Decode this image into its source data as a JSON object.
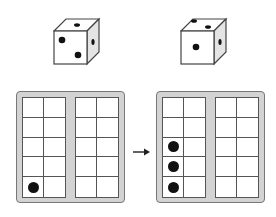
{
  "dice": [
    {
      "id": "die-left",
      "front_face_pips": 2,
      "top_face_pips": 1,
      "side_face_pips": 1
    },
    {
      "id": "die-right",
      "front_face_pips": 1,
      "top_face_pips": 2,
      "side_face_pips": 1
    }
  ],
  "ten_frames": [
    {
      "id": "frame-before",
      "filled_cells": [
        [
          4,
          0
        ]
      ]
    },
    {
      "id": "frame-after",
      "filled_cells": [
        [
          2,
          0
        ],
        [
          3,
          0
        ],
        [
          4,
          0
        ]
      ]
    }
  ],
  "arrow": {
    "direction": "right"
  },
  "colors": {
    "frame_bg": "#d3d3d3",
    "frame_border": "#777777",
    "grid_line": "#555555",
    "dot": "#111111"
  }
}
